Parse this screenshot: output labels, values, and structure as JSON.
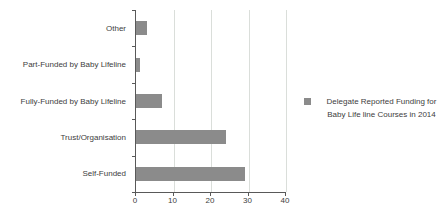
{
  "chart_data": {
    "type": "bar",
    "orientation": "horizontal",
    "title": "",
    "categories": [
      "Other",
      "Part-Funded by Baby Lifeline",
      "Fully-Funded by Baby Lifeline",
      "Trust/Organisation",
      "Self-Funded"
    ],
    "values": [
      3,
      1,
      7,
      24,
      29
    ],
    "series_name": "Delegate Reported Funding for Baby Life line Courses in 2014",
    "xlabel": "",
    "ylabel": "",
    "xlim": [
      0,
      40
    ],
    "x_ticks": [
      0,
      10,
      20,
      30,
      40
    ],
    "grid": true,
    "legend_position": "right"
  },
  "legend": {
    "line1": "Delegate Reported Funding for",
    "line2": "Baby Life line Courses in 2014"
  },
  "colors": {
    "bar": "#8b8b8b",
    "gridline": "#dadeda",
    "axis": "#595959",
    "text": "#404040",
    "background": "#ffffff"
  }
}
